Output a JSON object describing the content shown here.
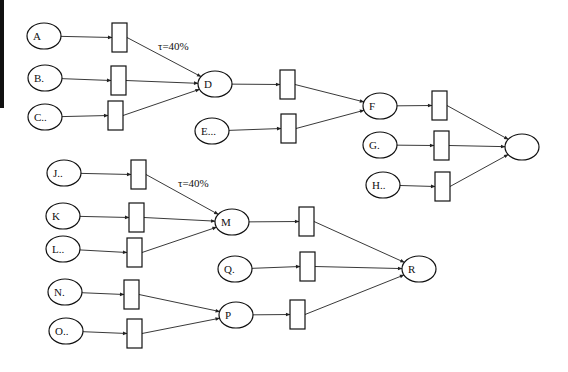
{
  "diagram": {
    "type": "petri-net-flow",
    "edge_bar": {
      "x": 0,
      "y": 0,
      "w": 4,
      "h": 108,
      "color": "#111111"
    },
    "places": [
      {
        "id": "A",
        "label": "A",
        "cx": 44,
        "cy": 36
      },
      {
        "id": "B",
        "label": "B.",
        "cx": 45,
        "cy": 78
      },
      {
        "id": "C",
        "label": "C..",
        "cx": 45,
        "cy": 117
      },
      {
        "id": "D",
        "label": "D",
        "cx": 215,
        "cy": 84
      },
      {
        "id": "E",
        "label": "E...",
        "cx": 212,
        "cy": 131
      },
      {
        "id": "F",
        "label": "F",
        "cx": 380,
        "cy": 106
      },
      {
        "id": "G",
        "label": "G.",
        "cx": 380,
        "cy": 145
      },
      {
        "id": "H",
        "label": "H..",
        "cx": 383,
        "cy": 185
      },
      {
        "id": "OUT",
        "label": "",
        "cx": 522,
        "cy": 147
      },
      {
        "id": "J",
        "label": "J..",
        "cx": 64,
        "cy": 173
      },
      {
        "id": "K",
        "label": "K",
        "cx": 63,
        "cy": 216
      },
      {
        "id": "L",
        "label": "L..",
        "cx": 63,
        "cy": 249
      },
      {
        "id": "M",
        "label": "M",
        "cx": 232,
        "cy": 222
      },
      {
        "id": "N",
        "label": "N.",
        "cx": 65,
        "cy": 292
      },
      {
        "id": "O",
        "label": "O..",
        "cx": 66,
        "cy": 331
      },
      {
        "id": "P",
        "label": "P",
        "cx": 236,
        "cy": 315
      },
      {
        "id": "Q",
        "label": "Q.",
        "cx": 235,
        "cy": 269
      },
      {
        "id": "R",
        "label": "R",
        "cx": 419,
        "cy": 269
      }
    ],
    "transitions": [
      {
        "id": "tA",
        "x": 112,
        "y": 23,
        "from": "A",
        "to": "D"
      },
      {
        "id": "tB",
        "x": 111,
        "y": 66,
        "from": "B",
        "to": "D"
      },
      {
        "id": "tC",
        "x": 108,
        "y": 101,
        "from": "C",
        "to": "D"
      },
      {
        "id": "tD",
        "x": 280,
        "y": 70,
        "from": "D",
        "to": "F"
      },
      {
        "id": "tE",
        "x": 281,
        "y": 114,
        "from": "E",
        "to": "F"
      },
      {
        "id": "tF",
        "x": 432,
        "y": 91,
        "from": "F",
        "to": "OUT"
      },
      {
        "id": "tG",
        "x": 434,
        "y": 131,
        "from": "G",
        "to": "OUT"
      },
      {
        "id": "tH",
        "x": 435,
        "y": 172,
        "from": "H",
        "to": "OUT"
      },
      {
        "id": "tJ",
        "x": 131,
        "y": 160,
        "from": "J",
        "to": "M"
      },
      {
        "id": "tK",
        "x": 129,
        "y": 203,
        "from": "K",
        "to": "M"
      },
      {
        "id": "tL",
        "x": 127,
        "y": 238,
        "from": "L",
        "to": "M"
      },
      {
        "id": "tM",
        "x": 299,
        "y": 207,
        "from": "M",
        "to": "R"
      },
      {
        "id": "tQ",
        "x": 300,
        "y": 252,
        "from": "Q",
        "to": "R"
      },
      {
        "id": "tN",
        "x": 124,
        "y": 280,
        "from": "N",
        "to": "P"
      },
      {
        "id": "tO",
        "x": 127,
        "y": 319,
        "from": "O",
        "to": "P"
      },
      {
        "id": "tP",
        "x": 290,
        "y": 300,
        "from": "P",
        "to": "R"
      }
    ],
    "annotations": [
      {
        "text": "τ=40%",
        "x": 158,
        "y": 50
      },
      {
        "text": "τ=40%",
        "x": 178,
        "y": 187
      }
    ]
  }
}
